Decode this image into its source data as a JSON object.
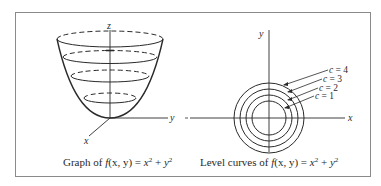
{
  "figure": {
    "frame_color": "#8a8a8a",
    "stroke_color": "#2a2a2a",
    "left_panel": {
      "title": "Graph of f(x, y) = x² + y²",
      "caption_prefix": "Graph of ",
      "caption_func": "f",
      "caption_args": "(x, y)",
      "caption_eq": " = ",
      "caption_x": "x",
      "caption_plus": " + ",
      "caption_y": "y",
      "caption_exp": "2",
      "axes": {
        "z": "z",
        "y": "y",
        "x": "x"
      },
      "cross_sections": 4
    },
    "right_panel": {
      "caption_prefix": "Level curves of ",
      "caption_func": "f",
      "caption_args": "(x, y)",
      "caption_eq": " = ",
      "caption_x": "x",
      "caption_plus": " + ",
      "caption_y": "y",
      "caption_exp": "2",
      "axes": {
        "y": "y",
        "x": "x"
      },
      "level_curves": [
        {
          "label": "c = 4",
          "c_var": "c",
          "value": "= 4"
        },
        {
          "label": "c = 3",
          "c_var": "c",
          "value": "= 3"
        },
        {
          "label": "c = 2",
          "c_var": "c",
          "value": "= 2"
        },
        {
          "label": "c = 1",
          "c_var": "c",
          "value": "= 1"
        }
      ]
    }
  }
}
